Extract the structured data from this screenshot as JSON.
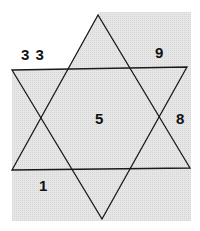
{
  "diagram": {
    "type": "star-of-david-puzzle",
    "colors": {
      "background": "#ffffff",
      "fill": "#e4e4e4",
      "stroke": "#1a1a1a",
      "text": "#111111"
    },
    "shaded_region": "68,69 98,14 100,12 191,12 191,221 12,221 12,70",
    "up_triangle": "98,15 12,170 190,168",
    "down_triangle": "12,70 187,67 102,219",
    "labels": [
      {
        "id": "top-left",
        "text": "3 3",
        "x": 21,
        "y": 60
      },
      {
        "id": "top-right",
        "text": "9",
        "x": 155,
        "y": 58
      },
      {
        "id": "center",
        "text": "5",
        "x": 95,
        "y": 124
      },
      {
        "id": "right",
        "text": "8",
        "x": 176,
        "y": 124
      },
      {
        "id": "bottom-left",
        "text": "1",
        "x": 39,
        "y": 191
      }
    ]
  }
}
